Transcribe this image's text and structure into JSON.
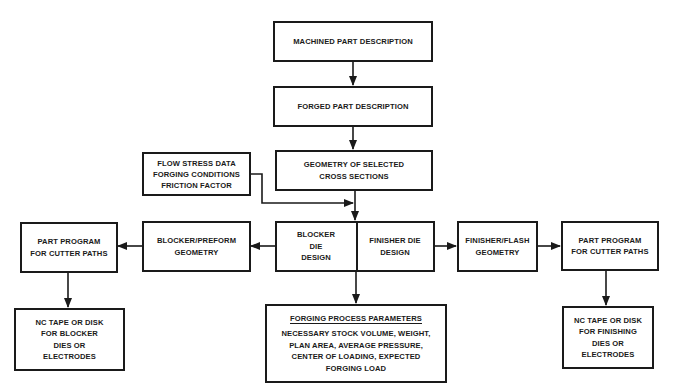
{
  "diagram": {
    "type": "flowchart",
    "nodes": {
      "machined": {
        "lines": [
          "MACHINED PART DESCRIPTION"
        ]
      },
      "forged": {
        "lines": [
          "FORGED PART DESCRIPTION"
        ]
      },
      "geometry": {
        "lines": [
          "GEOMETRY OF SELECTED",
          "CROSS SECTIONS"
        ]
      },
      "flow_stress": {
        "lines": [
          "FLOW STRESS DATA",
          "FORGING CONDITIONS",
          "FRICTION FACTOR"
        ]
      },
      "blocker_die": {
        "lines": [
          "BLOCKER",
          "DIE",
          "DESIGN"
        ]
      },
      "finisher_die": {
        "lines": [
          "FINISHER DIE",
          "DESIGN"
        ]
      },
      "blocker_preform": {
        "lines": [
          "BLOCKER/PREFORM",
          "GEOMETRY"
        ]
      },
      "part_program_left": {
        "lines": [
          "PART PROGRAM",
          "FOR CUTTER PATHS"
        ]
      },
      "nc_left": {
        "lines": [
          "NC TAPE OR DISK",
          "FOR BLOCKER",
          "DIES OR",
          "ELECTRODES"
        ]
      },
      "finisher_flash": {
        "lines": [
          "FINISHER/FLASH",
          "GEOMETRY"
        ]
      },
      "part_program_right": {
        "lines": [
          "PART PROGRAM",
          "FOR CUTTER PATHS"
        ]
      },
      "nc_right": {
        "lines": [
          "NC TAPE OR DISK",
          "FOR FINISHING",
          "DIES OR",
          "ELECTRODES"
        ]
      },
      "forging_params": {
        "title": "FORGING PROCESS PARAMETERS",
        "lines": [
          "NECESSARY STOCK VOLUME, WEIGHT,",
          "PLAN AREA, AVERAGE PRESSURE,",
          "CENTER OF LOADING, EXPECTED",
          "FORGING LOAD"
        ]
      }
    },
    "edges": [
      {
        "from": "machined",
        "to": "forged"
      },
      {
        "from": "forged",
        "to": "geometry"
      },
      {
        "from": "geometry",
        "to": "die_design"
      },
      {
        "from": "flow_stress",
        "to": "die_design"
      },
      {
        "from": "die_design",
        "to": "blocker_preform"
      },
      {
        "from": "blocker_preform",
        "to": "part_program_left"
      },
      {
        "from": "part_program_left",
        "to": "nc_left"
      },
      {
        "from": "die_design",
        "to": "finisher_flash"
      },
      {
        "from": "finisher_flash",
        "to": "part_program_right"
      },
      {
        "from": "part_program_right",
        "to": "nc_right"
      },
      {
        "from": "die_design",
        "to": "forging_params"
      }
    ]
  }
}
